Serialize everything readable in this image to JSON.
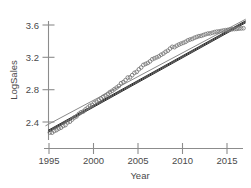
{
  "chart_data": {
    "type": "scatter",
    "title": "",
    "xlabel": "Year",
    "ylabel": "LogSales",
    "xlim": [
      1994.4,
      2017.2
    ],
    "ylim": [
      2.18,
      3.72
    ],
    "xticks": [
      1995,
      2000,
      2005,
      2010,
      2015
    ],
    "xticklabels": [
      "1995",
      "2000",
      "2005",
      "2010",
      "2015"
    ],
    "yticks": [
      2.4,
      2.8,
      3.2,
      3.6
    ],
    "yticklabels": [
      "2.4",
      "2.8",
      "3.2",
      "3.6"
    ],
    "grid": false,
    "legend": null,
    "marker": "open-circle",
    "marker_color": "#767676",
    "points": [
      {
        "x": 1995.1,
        "y": 2.27
      },
      {
        "x": 1995.35,
        "y": 2.268
      },
      {
        "x": 1995.6,
        "y": 2.289
      },
      {
        "x": 1995.85,
        "y": 2.3
      },
      {
        "x": 1996.1,
        "y": 2.318
      },
      {
        "x": 1996.35,
        "y": 2.33
      },
      {
        "x": 1996.6,
        "y": 2.352
      },
      {
        "x": 1996.85,
        "y": 2.362
      },
      {
        "x": 1997.1,
        "y": 2.395
      },
      {
        "x": 1997.35,
        "y": 2.404
      },
      {
        "x": 1997.6,
        "y": 2.43
      },
      {
        "x": 1997.85,
        "y": 2.455
      },
      {
        "x": 1998.1,
        "y": 2.47
      },
      {
        "x": 1998.35,
        "y": 2.5
      },
      {
        "x": 1998.6,
        "y": 2.52
      },
      {
        "x": 1998.85,
        "y": 2.53
      },
      {
        "x": 1999.1,
        "y": 2.556
      },
      {
        "x": 1999.35,
        "y": 2.578
      },
      {
        "x": 1999.6,
        "y": 2.6
      },
      {
        "x": 1999.85,
        "y": 2.612
      },
      {
        "x": 2000.1,
        "y": 2.638
      },
      {
        "x": 2000.35,
        "y": 2.65
      },
      {
        "x": 2000.6,
        "y": 2.672
      },
      {
        "x": 2000.85,
        "y": 2.69
      },
      {
        "x": 2001.1,
        "y": 2.712
      },
      {
        "x": 2001.35,
        "y": 2.728
      },
      {
        "x": 2001.6,
        "y": 2.748
      },
      {
        "x": 2001.85,
        "y": 2.77
      },
      {
        "x": 2002.1,
        "y": 2.786
      },
      {
        "x": 2002.35,
        "y": 2.806
      },
      {
        "x": 2002.6,
        "y": 2.826
      },
      {
        "x": 2002.85,
        "y": 2.846
      },
      {
        "x": 2003.1,
        "y": 2.88
      },
      {
        "x": 2003.35,
        "y": 2.894
      },
      {
        "x": 2003.6,
        "y": 2.918
      },
      {
        "x": 2003.85,
        "y": 2.95
      },
      {
        "x": 2004.1,
        "y": 2.952
      },
      {
        "x": 2004.35,
        "y": 2.98
      },
      {
        "x": 2004.6,
        "y": 3.008
      },
      {
        "x": 2004.85,
        "y": 3.02
      },
      {
        "x": 2005.1,
        "y": 3.052
      },
      {
        "x": 2005.35,
        "y": 3.074
      },
      {
        "x": 2005.6,
        "y": 3.106
      },
      {
        "x": 2005.85,
        "y": 3.118
      },
      {
        "x": 2006.1,
        "y": 3.13
      },
      {
        "x": 2006.35,
        "y": 3.15
      },
      {
        "x": 2006.6,
        "y": 3.176
      },
      {
        "x": 2006.85,
        "y": 3.188
      },
      {
        "x": 2007.1,
        "y": 3.2
      },
      {
        "x": 2007.35,
        "y": 3.212
      },
      {
        "x": 2007.6,
        "y": 3.232
      },
      {
        "x": 2007.85,
        "y": 3.246
      },
      {
        "x": 2008.1,
        "y": 3.268
      },
      {
        "x": 2008.35,
        "y": 3.282
      },
      {
        "x": 2008.6,
        "y": 3.308
      },
      {
        "x": 2008.85,
        "y": 3.33
      },
      {
        "x": 2009.1,
        "y": 3.326
      },
      {
        "x": 2009.35,
        "y": 3.344
      },
      {
        "x": 2009.6,
        "y": 3.358
      },
      {
        "x": 2009.85,
        "y": 3.37
      },
      {
        "x": 2010.1,
        "y": 3.38
      },
      {
        "x": 2010.35,
        "y": 3.392
      },
      {
        "x": 2010.6,
        "y": 3.41
      },
      {
        "x": 2010.85,
        "y": 3.42
      },
      {
        "x": 2011.1,
        "y": 3.428
      },
      {
        "x": 2011.35,
        "y": 3.442
      },
      {
        "x": 2011.6,
        "y": 3.452
      },
      {
        "x": 2011.85,
        "y": 3.462
      },
      {
        "x": 2012.1,
        "y": 3.466
      },
      {
        "x": 2012.35,
        "y": 3.476
      },
      {
        "x": 2012.6,
        "y": 3.486
      },
      {
        "x": 2012.85,
        "y": 3.494
      },
      {
        "x": 2013.1,
        "y": 3.496
      },
      {
        "x": 2013.35,
        "y": 3.504
      },
      {
        "x": 2013.6,
        "y": 3.512
      },
      {
        "x": 2013.85,
        "y": 3.518
      },
      {
        "x": 2014.1,
        "y": 3.52
      },
      {
        "x": 2014.35,
        "y": 3.526
      },
      {
        "x": 2014.6,
        "y": 3.532
      },
      {
        "x": 2014.85,
        "y": 3.536
      },
      {
        "x": 2015.1,
        "y": 3.54
      },
      {
        "x": 2015.35,
        "y": 3.544
      },
      {
        "x": 2015.6,
        "y": 3.548
      },
      {
        "x": 2015.85,
        "y": 3.55
      },
      {
        "x": 2016.1,
        "y": 3.552
      },
      {
        "x": 2016.35,
        "y": 3.556
      },
      {
        "x": 2016.6,
        "y": 3.558
      },
      {
        "x": 2016.85,
        "y": 3.56
      }
    ],
    "lines": [
      {
        "name": "thin-fit",
        "style": "thin",
        "color": "#8a8a8a",
        "width": 1.0,
        "x0": 1994.6,
        "y0": 2.352,
        "x1": 2017.1,
        "y1": 3.672
      },
      {
        "name": "thick-fit-a",
        "style": "thick",
        "color": "#2e2e2e",
        "width": 1.0,
        "x0": 1994.9,
        "y0": 2.272,
        "x1": 2017.1,
        "y1": 3.628
      },
      {
        "name": "thick-fit-b",
        "style": "thick",
        "color": "#3c3c3c",
        "width": 1.0,
        "x0": 1994.9,
        "y0": 2.285,
        "x1": 2017.1,
        "y1": 3.641
      },
      {
        "name": "thick-fit-c",
        "style": "thick",
        "color": "#4a4a4a",
        "width": 1.0,
        "x0": 1994.9,
        "y0": 2.297,
        "x1": 2017.1,
        "y1": 3.653
      }
    ]
  },
  "axes": {
    "x_label": "Year",
    "y_label": "LogSales",
    "x_tick_labels": [
      "1995",
      "2000",
      "2005",
      "2010",
      "2015"
    ],
    "y_tick_labels": [
      "2.4",
      "2.8",
      "3.2",
      "3.6"
    ],
    "axis_color": "#8c8c8c",
    "text_color": "#4a4a4a"
  }
}
